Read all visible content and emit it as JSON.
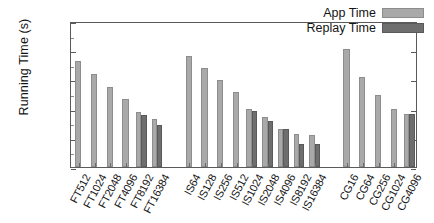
{
  "chart_data": {
    "type": "bar",
    "title": "",
    "xlabel": "",
    "ylabel": "Running Time (s)",
    "yscale": "log",
    "ylim": [
      1,
      1024
    ],
    "yticks": [
      1,
      4,
      16,
      64,
      256,
      1024
    ],
    "ytick_labels": [
      "1",
      "4",
      "16",
      "64",
      "256",
      "1024"
    ],
    "grid": false,
    "legend_position": "top-right",
    "legend": [
      "App Time",
      "Replay Time"
    ],
    "categories": [
      "FT512",
      "FT1024",
      "FT2048",
      "FT4096",
      "FT8192",
      "FT16384",
      "IS64",
      "IS128",
      "IS256",
      "IS512",
      "IS1024",
      "IS2048",
      "IS4096",
      "IS8192",
      "IS16384",
      "CG16",
      "CG64",
      "CG256",
      "CG1024",
      "CG4096"
    ],
    "groups": [
      {
        "name": "FT",
        "categories": [
          "FT512",
          "FT1024",
          "FT2048",
          "FT4096",
          "FT8192",
          "FT16384"
        ]
      },
      {
        "name": "IS",
        "categories": [
          "IS64",
          "IS128",
          "IS256",
          "IS512",
          "IS1024",
          "IS2048",
          "IS4096",
          "IS8192",
          "IS16384"
        ]
      },
      {
        "name": "CG",
        "categories": [
          "CG16",
          "CG64",
          "CG256",
          "CG1024",
          "CG4096"
        ]
      }
    ],
    "series": [
      {
        "name": "App Time",
        "color": "#a9a9a9",
        "values": [
          150,
          82,
          45,
          25,
          13.5,
          10,
          190,
          110,
          63,
          36,
          16,
          10.5,
          6,
          4.8,
          4.5,
          270,
          72,
          30,
          15.5,
          12.5
        ]
      },
      {
        "name": "Replay Time",
        "color": "#6e6e6e",
        "values": [
          null,
          null,
          null,
          null,
          12,
          7.5,
          null,
          null,
          null,
          null,
          14,
          9,
          6,
          3,
          3,
          null,
          null,
          null,
          null,
          12.5
        ]
      }
    ]
  },
  "axis": {
    "y_title": "Running Time (s)"
  },
  "legend": {
    "entries": [
      {
        "label": "App Time",
        "swatch": "app"
      },
      {
        "label": "Replay Time",
        "swatch": "replay"
      }
    ]
  }
}
